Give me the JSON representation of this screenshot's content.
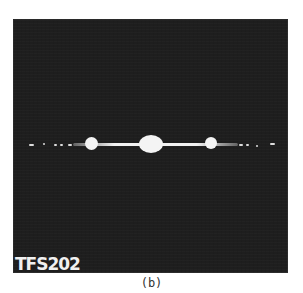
{
  "figure": {
    "label": "TFS202",
    "caption": "(b)",
    "background_color": "#1e1e1e",
    "spot_color": "#f4f4f4"
  }
}
